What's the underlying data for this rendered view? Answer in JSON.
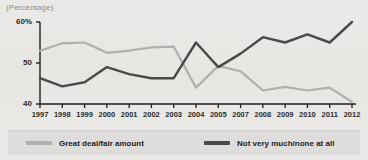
{
  "chart_data": {
    "type": "line",
    "title": "",
    "axis_note": "(Percentage)",
    "xlabel": "",
    "ylabel": "",
    "ylim": [
      40,
      60
    ],
    "yticks": [
      40,
      50,
      60
    ],
    "ytick_labels": [
      "40",
      "50",
      "60%"
    ],
    "grid": false,
    "legend_position": "bottom",
    "categories": [
      "1997",
      "1998",
      "1999",
      "2000",
      "2001",
      "2002",
      "2003",
      "2004",
      "2005",
      "2007",
      "2008",
      "2009",
      "2010",
      "2011",
      "2012"
    ],
    "series": [
      {
        "name": "Great deal/fair amount",
        "color": "#b0b0ae",
        "values": [
          53.0,
          54.8,
          55.0,
          52.5,
          53.0,
          53.8,
          54.0,
          44.0,
          49.3,
          48.0,
          43.3,
          44.2,
          43.3,
          44.0,
          40.5
        ]
      },
      {
        "name": "Not very much/none at all",
        "color": "#4a4a4a",
        "values": [
          46.3,
          44.3,
          45.3,
          49.0,
          47.3,
          46.3,
          46.3,
          55.0,
          49.0,
          52.3,
          56.3,
          55.0,
          57.0,
          55.0,
          60.0
        ]
      }
    ]
  },
  "legend": {
    "items": [
      {
        "label": "Great deal/fair amount",
        "color": "#b0b0ae"
      },
      {
        "label": "Not very much/none at all",
        "color": "#4a4a4a"
      }
    ]
  }
}
